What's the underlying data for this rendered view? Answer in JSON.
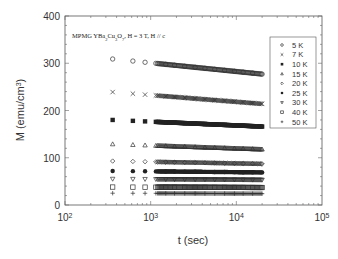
{
  "chart_data": {
    "type": "scatter",
    "title": "",
    "annotation": "MPMG YBa2Cu3O7, H = 3 T, H // c",
    "xlabel": "t (sec)",
    "ylabel": "M (emu/cm3)",
    "xscale": "log",
    "xlim": [
      100,
      100000
    ],
    "ylim": [
      0,
      400
    ],
    "x_ticks": [
      "10^2",
      "10^3",
      "10^4",
      "10^5"
    ],
    "y_ticks": [
      0,
      100,
      200,
      300,
      400
    ],
    "grid": false,
    "legend_position": "upper right",
    "x": [
      360,
      620,
      860,
      1150,
      1500,
      1900,
      2500,
      3300,
      4300,
      5600,
      7300,
      9500,
      12000,
      15500,
      20000
    ],
    "series": [
      {
        "name": "5 K",
        "marker": "circle-open",
        "start": 309,
        "end": 277
      },
      {
        "name": "7 K",
        "marker": "x",
        "start": 239,
        "end": 214
      },
      {
        "name": "10 K",
        "marker": "square-filled",
        "start": 180,
        "end": 166
      },
      {
        "name": "15 K",
        "marker": "triangle-open",
        "start": 129,
        "end": 118
      },
      {
        "name": "20 K",
        "marker": "diamond-open",
        "start": 93,
        "end": 87
      },
      {
        "name": "25 K",
        "marker": "circle-filled",
        "start": 72,
        "end": 69
      },
      {
        "name": "30 K",
        "marker": "triangle-down-open",
        "start": 55,
        "end": 53
      },
      {
        "name": "40 K",
        "marker": "square-open",
        "start": 38,
        "end": 37
      },
      {
        "name": "50 K",
        "marker": "plus",
        "start": 25,
        "end": 24
      }
    ]
  },
  "labels": {
    "xlabel": "t (sec)",
    "ylabel_main": "M (emu/cm",
    "ylabel_sup": "3",
    "ylabel_end": ")",
    "annotation_main": "MPMG YBa",
    "annotation_rest": ", H = 3 T, H // c"
  }
}
